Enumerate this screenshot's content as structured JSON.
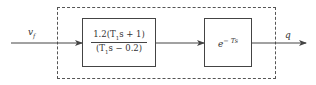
{
  "diagram": {
    "type": "block-diagram",
    "input_signal": {
      "label": "v",
      "subscript": "f"
    },
    "output_signal": {
      "label": "q"
    },
    "blocks": [
      {
        "id": "block-1",
        "numerator": "1.2(T",
        "numerator_sub": "1",
        "numerator_rest": "s + 1)",
        "denominator": "(T",
        "denominator_sub": "1",
        "denominator_rest": "s − 0.2)"
      },
      {
        "id": "block-2",
        "base": "e",
        "exponent": "− Ts"
      }
    ],
    "frame": {
      "style": "dashed"
    },
    "colors": {
      "line": "#444444",
      "background": "#ffffff"
    }
  }
}
